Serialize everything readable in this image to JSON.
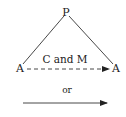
{
  "diagram": {
    "top_node": "P",
    "left_node": "A",
    "right_node": "A",
    "dashed_edge_label": "C and M",
    "separator_text": "or",
    "line_color": "#333333"
  }
}
